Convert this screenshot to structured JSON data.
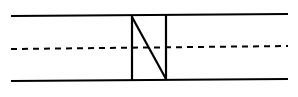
{
  "diagram": {
    "type": "handwriting-practice-lines",
    "letter": "N",
    "guide_lines": [
      "top-line",
      "midline-dashed",
      "baseline"
    ],
    "stroke_color": "#000000",
    "background_color": "#ffffff"
  }
}
